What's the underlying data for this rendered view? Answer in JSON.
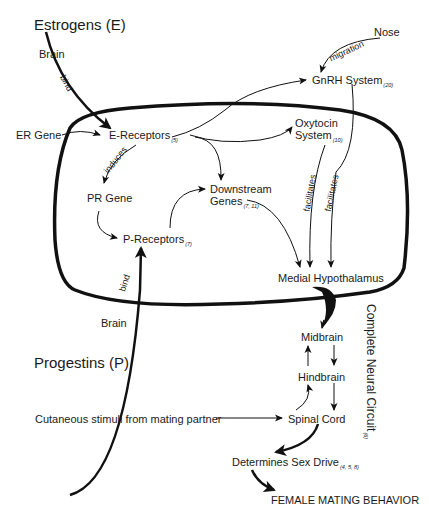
{
  "diagram": {
    "nodes": {
      "estrogens": "Estrogens (E)",
      "brain_top": "Brain",
      "er_gene": "ER Gene",
      "e_receptors": "E-Receptors",
      "e_receptors_ref": "(5)",
      "pr_gene": "PR Gene",
      "p_receptors": "P-Receptors",
      "p_receptors_ref": "(7)",
      "downstream_line1": "Downstream",
      "downstream_line2": "Genes",
      "downstream_ref": "(7, 11)",
      "gnrh": "GnRH System",
      "gnrh_ref": "(20)",
      "nose": "Nose",
      "oxytocin_line1": "Oxytocin",
      "oxytocin_line2": "System",
      "oxytocin_ref": "(10)",
      "medial_hypothalamus": "Medial Hypothalamus",
      "midbrain": "Midbrain",
      "hindbrain": "Hindbrain",
      "spinal_cord": "Spinal Cord",
      "cutaneous": "Cutaneous stimuli from mating partner",
      "sex_drive": "Determines Sex Drive",
      "sex_drive_ref": "(4, 5, 8)",
      "female_behavior": "FEMALE MATING BEHAVIOR",
      "brain_bottom": "Brain",
      "progestins": "Progestins (P)",
      "complete_circuit": "Complete Neural Circuit",
      "complete_circuit_ref": "(6)"
    },
    "edge_labels": {
      "bind_top": "bind",
      "bind_bottom": "bind",
      "induces": "induces",
      "migration": "migration",
      "facilitates_1": "facilitates",
      "facilitates_2": "facilitates"
    },
    "colors": {
      "stroke": "#111111",
      "text": "#1a1a1a",
      "background": "#ffffff"
    }
  }
}
